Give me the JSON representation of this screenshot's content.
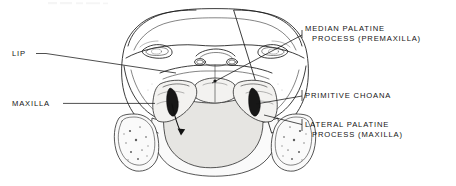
{
  "figure": {
    "background_color": "#ffffff",
    "ink_color": "#141414",
    "width": 456,
    "height": 186
  },
  "labels": [
    {
      "id": "lip",
      "name": "lip",
      "lines": [
        "LIP"
      ],
      "side": "left",
      "text_x": 12,
      "text_y": 56,
      "anchor": "start"
    },
    {
      "id": "maxilla",
      "name": "maxilla",
      "lines": [
        "MAXILLA"
      ],
      "side": "left",
      "text_x": 12,
      "text_y": 106,
      "anchor": "start"
    },
    {
      "id": "median-palatine-process",
      "name": "median-palatine-process-premaxilla",
      "lines": [
        "MEDIAN PALATINE",
        "PROCESS (PREMAXILLA)"
      ],
      "side": "right",
      "text_x": 305,
      "text_y": 31,
      "anchor": "start"
    },
    {
      "id": "primitive-choana",
      "name": "primitive-choana",
      "lines": [
        "PRIMITIVE CHOANA"
      ],
      "side": "right",
      "text_x": 305,
      "text_y": 98,
      "anchor": "start"
    },
    {
      "id": "lateral-palatine-process",
      "name": "lateral-palatine-process-maxilla",
      "lines": [
        "LATERAL PALATINE",
        "PROCESS (MAXILLA)"
      ],
      "side": "right",
      "text_x": 305,
      "text_y": 127,
      "anchor": "start"
    }
  ],
  "anatomy": {
    "structures": [
      "frontal-prominence",
      "left-eye",
      "right-eye",
      "external-nares",
      "median-palatine-process",
      "left-lateral-palatine-process",
      "right-lateral-palatine-process",
      "left-primitive-choana",
      "right-primitive-choana",
      "left-mandibular-process",
      "right-mandibular-process",
      "tongue",
      "lower-jaw"
    ],
    "arrow_note": "airflow arrow through left primitive choana"
  }
}
